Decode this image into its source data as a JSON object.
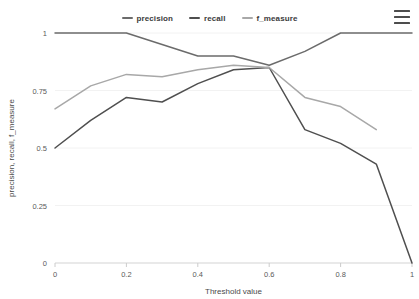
{
  "legend": {
    "items": [
      {
        "label": "precision",
        "color": "#6b6b6b"
      },
      {
        "label": "recall",
        "color": "#4f4f4f"
      },
      {
        "label": "f_measure",
        "color": "#a8a8a8"
      }
    ]
  },
  "menu": {
    "icon": "hamburger-menu-icon",
    "label": "Chart menu"
  },
  "chart_data": {
    "type": "line",
    "title": "",
    "xlabel": "Threshold value",
    "ylabel": "precision, recall, f_measure",
    "xlim": [
      0,
      1
    ],
    "ylim": [
      0,
      1
    ],
    "grid": true,
    "legend_position": "top-center",
    "x": [
      0,
      0.1,
      0.2,
      0.3,
      0.4,
      0.5,
      0.6,
      0.7,
      0.8,
      0.9,
      1
    ],
    "xticks": [
      "0",
      "0.2",
      "0.4",
      "0.6",
      "0.8",
      "1"
    ],
    "xtick_values": [
      0,
      0.2,
      0.4,
      0.6,
      0.8,
      1
    ],
    "yticks": [
      "0",
      "0.25",
      "0.5",
      "0.75",
      "1"
    ],
    "ytick_values": [
      0,
      0.25,
      0.5,
      0.75,
      1
    ],
    "series": [
      {
        "name": "precision",
        "color": "#6b6b6b",
        "values": [
          1,
          1,
          1,
          0.95,
          0.9,
          0.9,
          0.86,
          0.92,
          1,
          1,
          1
        ]
      },
      {
        "name": "recall",
        "color": "#4f4f4f",
        "values": [
          0.5,
          0.62,
          0.72,
          0.7,
          0.78,
          0.84,
          0.85,
          0.58,
          0.52,
          0.43,
          0
        ]
      },
      {
        "name": "f_measure",
        "color": "#a8a8a8",
        "values": [
          0.67,
          0.77,
          0.82,
          0.81,
          0.84,
          0.86,
          0.85,
          0.72,
          0.68,
          0.58,
          null
        ]
      }
    ]
  }
}
